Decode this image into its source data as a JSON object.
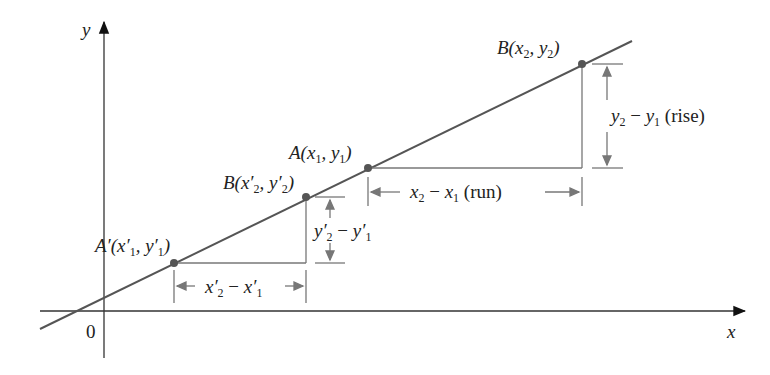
{
  "diagram": {
    "axes": {
      "x_label": "x",
      "y_label": "y",
      "origin_label": "0"
    },
    "points": {
      "A_prime": "A′(x′1, y′1)",
      "B_prime": "B(x′2, y′2)",
      "A": "A(x1, y1)",
      "B": "B(x2, y2)"
    },
    "labels": {
      "run": "x2 − x1 (run)",
      "rise": "y2 − y1 (rise)",
      "run_prime": "x′2 − x′1",
      "rise_prime": "y′2 − y′1"
    },
    "colors": {
      "line": "#555555",
      "dimension": "#777777",
      "point": "#555555",
      "axes": "#333333"
    }
  }
}
